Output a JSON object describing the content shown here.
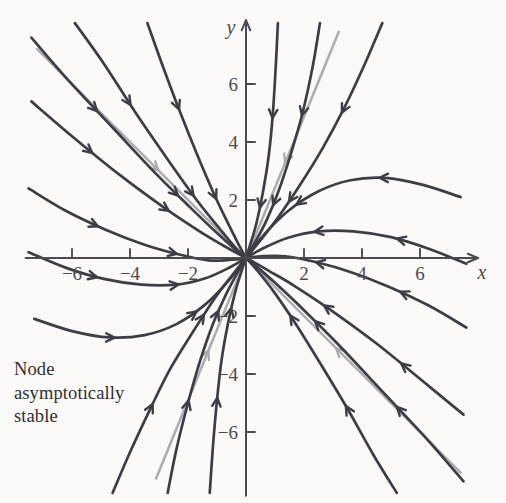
{
  "figure": {
    "kind": "phase-portrait",
    "background_color": "#fbfaf8",
    "width": 506,
    "height": 503,
    "caption_lines": [
      "Node",
      "asymptotically",
      "stable"
    ],
    "caption_color": "#2f2f33"
  },
  "axes": {
    "x_label": "x",
    "y_label": "y",
    "axis_color": "#4a4a50",
    "origin_px": [
      246,
      258
    ],
    "unit_px": 29.0,
    "x_ticks": [
      {
        "value": -6,
        "label": "−6"
      },
      {
        "value": -4,
        "label": "−4"
      },
      {
        "value": -2,
        "label": "−2"
      },
      {
        "value": 2,
        "label": "2"
      },
      {
        "value": 4,
        "label": "4"
      },
      {
        "value": 6,
        "label": "6"
      }
    ],
    "y_ticks": [
      {
        "value": 6,
        "label": "6"
      },
      {
        "value": 4,
        "label": "4"
      },
      {
        "value": 2,
        "label": "2"
      },
      {
        "value": -2,
        "label": "−2"
      },
      {
        "value": -4,
        "label": "−4"
      },
      {
        "value": -6,
        "label": "−6"
      }
    ],
    "x_range": [
      -7.6,
      8.0
    ],
    "y_range": [
      -8.2,
      8.2
    ],
    "tick_len_px": 9,
    "tick_label_size_px": 19
  },
  "chart_data": {
    "type": "line",
    "title": "Node asymptotically stable",
    "xlabel": "x",
    "ylabel": "y",
    "xlim": [
      -7.6,
      8.0
    ],
    "ylim": [
      -8.2,
      8.2
    ],
    "grid": false,
    "legend": "none",
    "system": {
      "description": "Linear planar system with two negative real eigenvalues; all trajectories approach the origin tangent to the slow eigendirection.",
      "equilibrium": [
        0,
        0
      ],
      "classification": "stable node",
      "stability": "asymptotically stable",
      "flow_direction": "inward toward origin"
    },
    "eigendirections": [
      {
        "name": "slow-eigendirection",
        "slope": -1.0,
        "color": "#a9a9ae",
        "role": "tangent direction of approach",
        "endpoints": [
          [
            -7.2,
            7.2
          ],
          [
            7.4,
            -7.4
          ]
        ]
      },
      {
        "name": "fast-eigendirection",
        "slope": 2.45,
        "color": "#a9a9ae",
        "role": "steep straight-line solutions",
        "endpoints": [
          [
            -3.1,
            -7.6
          ],
          [
            3.2,
            7.8
          ]
        ]
      }
    ],
    "series": [
      {
        "name": "traj-ul-1",
        "color": "#3d3d46",
        "points": [
          [
            -7.4,
            5.4
          ],
          [
            -6.0,
            4.2
          ],
          [
            -4.4,
            2.9
          ],
          [
            -2.8,
            1.72
          ],
          [
            -1.6,
            0.92
          ],
          [
            -0.8,
            0.44
          ],
          [
            -0.3,
            0.16
          ],
          [
            0,
            0
          ]
        ],
        "arrows": [
          0.3,
          0.66
        ]
      },
      {
        "name": "traj-ul-2",
        "color": "#3d3d46",
        "points": [
          [
            -7.4,
            7.6
          ],
          [
            -6.1,
            6.1
          ],
          [
            -4.6,
            4.5
          ],
          [
            -3.1,
            2.9
          ],
          [
            -1.9,
            1.72
          ],
          [
            -1.0,
            0.86
          ],
          [
            -0.4,
            0.32
          ],
          [
            0,
            0
          ]
        ],
        "arrows": [
          0.32,
          0.7
        ]
      },
      {
        "name": "traj-ul-3",
        "color": "#3d3d46",
        "points": [
          [
            -5.9,
            8.1
          ],
          [
            -4.9,
            6.7
          ],
          [
            -3.8,
            5.0
          ],
          [
            -2.7,
            3.4
          ],
          [
            -1.7,
            2.0
          ],
          [
            -0.9,
            1.0
          ],
          [
            -0.35,
            0.34
          ],
          [
            0,
            0
          ]
        ],
        "arrows": [
          0.34,
          0.72
        ]
      },
      {
        "name": "traj-ul-4",
        "color": "#3d3d46",
        "points": [
          [
            -3.4,
            8.1
          ],
          [
            -2.9,
            6.7
          ],
          [
            -2.3,
            5.1
          ],
          [
            -1.7,
            3.6
          ],
          [
            -1.1,
            2.2
          ],
          [
            -0.6,
            1.16
          ],
          [
            -0.22,
            0.4
          ],
          [
            0,
            0
          ]
        ],
        "arrows": [
          0.36,
          0.74
        ]
      },
      {
        "name": "traj-left-1",
        "color": "#3d3d46",
        "points": [
          [
            -7.5,
            2.4
          ],
          [
            -6.2,
            1.62
          ],
          [
            -4.8,
            0.96
          ],
          [
            -3.5,
            0.46
          ],
          [
            -2.3,
            0.12
          ],
          [
            -1.3,
            -0.08
          ],
          [
            -0.5,
            -0.06
          ],
          [
            0,
            0
          ]
        ],
        "arrows": [
          0.34,
          0.7
        ]
      },
      {
        "name": "traj-left-2",
        "color": "#3d3d46",
        "points": [
          [
            -7.5,
            0.2
          ],
          [
            -6.2,
            -0.34
          ],
          [
            -4.9,
            -0.72
          ],
          [
            -3.6,
            -0.92
          ],
          [
            -2.4,
            -0.92
          ],
          [
            -1.4,
            -0.7
          ],
          [
            -0.55,
            -0.32
          ],
          [
            0,
            0
          ]
        ],
        "arrows": [
          0.32,
          0.68
        ]
      },
      {
        "name": "traj-left-3",
        "color": "#3d3d46",
        "points": [
          [
            -7.3,
            -2.1
          ],
          [
            -6.0,
            -2.52
          ],
          [
            -4.7,
            -2.74
          ],
          [
            -3.5,
            -2.66
          ],
          [
            -2.4,
            -2.28
          ],
          [
            -1.4,
            -1.6
          ],
          [
            -0.6,
            -0.78
          ],
          [
            0,
            0
          ]
        ],
        "arrows": [
          0.34,
          0.7
        ]
      },
      {
        "name": "traj-ll-1",
        "color": "#3d3d46",
        "points": [
          [
            -4.6,
            -8.1
          ],
          [
            -4.0,
            -6.7
          ],
          [
            -3.3,
            -5.2
          ],
          [
            -2.6,
            -3.8
          ],
          [
            -1.8,
            -2.5
          ],
          [
            -1.1,
            -1.42
          ],
          [
            -0.45,
            -0.56
          ],
          [
            0,
            0
          ]
        ],
        "arrows": [
          0.36,
          0.74
        ]
      },
      {
        "name": "traj-ll-2",
        "color": "#3d3d46",
        "points": [
          [
            -2.7,
            -8.1
          ],
          [
            -2.4,
            -6.6
          ],
          [
            -2.0,
            -5.0
          ],
          [
            -1.6,
            -3.6
          ],
          [
            -1.15,
            -2.3
          ],
          [
            -0.7,
            -1.28
          ],
          [
            -0.28,
            -0.48
          ],
          [
            0,
            0
          ]
        ],
        "arrows": [
          0.38,
          0.76
        ]
      },
      {
        "name": "traj-ll-3",
        "color": "#3d3d46",
        "points": [
          [
            -1.25,
            -8.1
          ],
          [
            -1.14,
            -6.5
          ],
          [
            -1.0,
            -4.9
          ],
          [
            -0.84,
            -3.5
          ],
          [
            -0.62,
            -2.25
          ],
          [
            -0.38,
            -1.2
          ],
          [
            -0.15,
            -0.44
          ],
          [
            0,
            0
          ]
        ],
        "arrows": [
          0.4,
          0.78
        ]
      },
      {
        "name": "traj-lr-1",
        "color": "#3d3d46",
        "points": [
          [
            7.5,
            -5.4
          ],
          [
            6.1,
            -4.25
          ],
          [
            4.5,
            -2.95
          ],
          [
            2.9,
            -1.78
          ],
          [
            1.65,
            -0.95
          ],
          [
            0.8,
            -0.45
          ],
          [
            0.3,
            -0.16
          ],
          [
            0,
            0
          ]
        ],
        "arrows": [
          0.3,
          0.66
        ]
      },
      {
        "name": "traj-lr-2",
        "color": "#3d3d46",
        "points": [
          [
            7.5,
            -7.7
          ],
          [
            6.2,
            -6.2
          ],
          [
            4.7,
            -4.6
          ],
          [
            3.2,
            -3.0
          ],
          [
            2.0,
            -1.8
          ],
          [
            1.05,
            -0.9
          ],
          [
            0.42,
            -0.34
          ],
          [
            0,
            0
          ]
        ],
        "arrows": [
          0.32,
          0.7
        ]
      },
      {
        "name": "traj-lr-3",
        "color": "#3d3d46",
        "points": [
          [
            5.2,
            -8.1
          ],
          [
            4.4,
            -6.8
          ],
          [
            3.5,
            -5.2
          ],
          [
            2.6,
            -3.7
          ],
          [
            1.7,
            -2.25
          ],
          [
            0.95,
            -1.15
          ],
          [
            0.36,
            -0.4
          ],
          [
            0,
            0
          ]
        ],
        "arrows": [
          0.36,
          0.74
        ]
      },
      {
        "name": "traj-right-1",
        "color": "#3d3d46",
        "points": [
          [
            7.6,
            -2.4
          ],
          [
            6.3,
            -1.64
          ],
          [
            4.9,
            -0.98
          ],
          [
            3.6,
            -0.48
          ],
          [
            2.4,
            -0.14
          ],
          [
            1.35,
            0.06
          ],
          [
            0.5,
            0.06
          ],
          [
            0,
            0
          ]
        ],
        "arrows": [
          0.32,
          0.7
        ]
      },
      {
        "name": "traj-right-2",
        "color": "#3d3d46",
        "points": [
          [
            7.6,
            -0.2
          ],
          [
            6.3,
            0.32
          ],
          [
            5.0,
            0.72
          ],
          [
            3.7,
            0.92
          ],
          [
            2.5,
            0.92
          ],
          [
            1.45,
            0.7
          ],
          [
            0.56,
            0.32
          ],
          [
            0,
            0
          ]
        ],
        "arrows": [
          0.32,
          0.68
        ]
      },
      {
        "name": "traj-right-3",
        "color": "#3d3d46",
        "points": [
          [
            7.4,
            2.1
          ],
          [
            6.1,
            2.52
          ],
          [
            4.8,
            2.76
          ],
          [
            3.6,
            2.68
          ],
          [
            2.5,
            2.3
          ],
          [
            1.45,
            1.62
          ],
          [
            0.6,
            0.78
          ],
          [
            0,
            0
          ]
        ],
        "arrows": [
          0.34,
          0.7
        ]
      },
      {
        "name": "traj-ur-1",
        "color": "#3d3d46",
        "points": [
          [
            4.7,
            8.1
          ],
          [
            4.1,
            6.7
          ],
          [
            3.4,
            5.2
          ],
          [
            2.65,
            3.8
          ],
          [
            1.85,
            2.5
          ],
          [
            1.12,
            1.42
          ],
          [
            0.46,
            0.56
          ],
          [
            0,
            0
          ]
        ],
        "arrows": [
          0.36,
          0.74
        ]
      },
      {
        "name": "traj-ur-2",
        "color": "#3d3d46",
        "points": [
          [
            2.55,
            8.1
          ],
          [
            2.3,
            6.6
          ],
          [
            1.95,
            5.0
          ],
          [
            1.55,
            3.6
          ],
          [
            1.12,
            2.3
          ],
          [
            0.7,
            1.28
          ],
          [
            0.28,
            0.48
          ],
          [
            0,
            0
          ]
        ],
        "arrows": [
          0.38,
          0.76
        ]
      },
      {
        "name": "traj-ur-3",
        "color": "#3d3d46",
        "points": [
          [
            1.1,
            8.1
          ],
          [
            1.02,
            6.5
          ],
          [
            0.92,
            4.9
          ],
          [
            0.78,
            3.5
          ],
          [
            0.58,
            2.25
          ],
          [
            0.36,
            1.2
          ],
          [
            0.14,
            0.44
          ],
          [
            0,
            0
          ]
        ],
        "arrows": [
          0.4,
          0.78
        ]
      }
    ]
  }
}
